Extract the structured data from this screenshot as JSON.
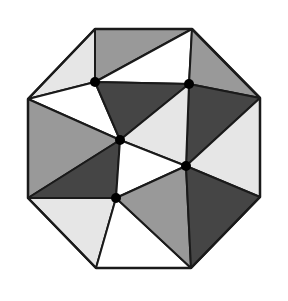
{
  "figure": {
    "colors": {
      "light": "#e6e6e6",
      "medium": "#999999",
      "dark": "#454545",
      "white": "#ffffff",
      "stroke": "#1a1a1a",
      "point": "#000000"
    },
    "octagon_vertices": {
      "TL": [
        95,
        29
      ],
      "TR": [
        192,
        29
      ],
      "RT": [
        260,
        98
      ],
      "RB": [
        260,
        197
      ],
      "BR": [
        191,
        268
      ],
      "BL": [
        96,
        268
      ],
      "LB": [
        28,
        198
      ],
      "LT": [
        28,
        99
      ]
    },
    "interior_points": {
      "P1": [
        95,
        82
      ],
      "P2": [
        189,
        84
      ],
      "P3": [
        120,
        140
      ],
      "P4": [
        186,
        166
      ],
      "P5": [
        116,
        198
      ]
    },
    "triangles": [
      {
        "v": [
          "TL",
          "LT",
          "P1"
        ],
        "fill": "light"
      },
      {
        "v": [
          "TL",
          "TR",
          "P1"
        ],
        "fill": "medium"
      },
      {
        "v": [
          "TR",
          "P1",
          "P2"
        ],
        "fill": "white"
      },
      {
        "v": [
          "TR",
          "RT",
          "P2"
        ],
        "fill": "medium"
      },
      {
        "v": [
          "LT",
          "P1",
          "P3"
        ],
        "fill": "white"
      },
      {
        "v": [
          "P1",
          "P2",
          "P3"
        ],
        "fill": "dark"
      },
      {
        "v": [
          "P2",
          "RT",
          "P4"
        ],
        "fill": "dark"
      },
      {
        "v": [
          "RT",
          "RB",
          "P4"
        ],
        "fill": "light"
      },
      {
        "v": [
          "P2",
          "P3",
          "P4"
        ],
        "fill": "light"
      },
      {
        "v": [
          "LT",
          "LB",
          "P3"
        ],
        "fill": "medium"
      },
      {
        "v": [
          "LB",
          "P3",
          "P5"
        ],
        "fill": "dark"
      },
      {
        "v": [
          "P3",
          "P4",
          "P5"
        ],
        "fill": "white"
      },
      {
        "v": [
          "LB",
          "P5",
          "BL"
        ],
        "fill": "light"
      },
      {
        "v": [
          "P5",
          "BL",
          "BR"
        ],
        "fill": "white"
      },
      {
        "v": [
          "P5",
          "P4",
          "BR"
        ],
        "fill": "medium"
      },
      {
        "v": [
          "P4",
          "BR",
          "RB"
        ],
        "fill": "dark"
      }
    ]
  }
}
